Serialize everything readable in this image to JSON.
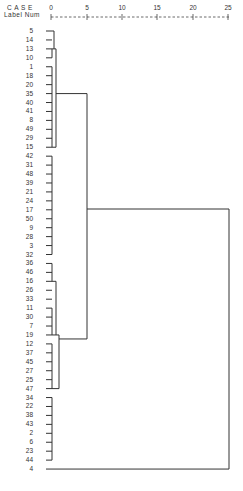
{
  "header": {
    "case_label": "C A S E",
    "label_num": "Label  Num"
  },
  "axis": {
    "ticks": [
      "0",
      "5",
      "10",
      "15",
      "20",
      "25"
    ],
    "line": "+---------+---------+---------+---------+---------+"
  },
  "leaves": [
    "5",
    "14",
    "13",
    "10",
    "1",
    "18",
    "20",
    "35",
    "40",
    "41",
    "8",
    "49",
    "29",
    "15",
    "42",
    "31",
    "48",
    "39",
    "21",
    "24",
    "17",
    "50",
    "9",
    "28",
    "3",
    "32",
    "36",
    "46",
    "16",
    "26",
    "33",
    "11",
    "30",
    "7",
    "19",
    "12",
    "37",
    "45",
    "27",
    "25",
    "47",
    "34",
    "22",
    "38",
    "43",
    "2",
    "6",
    "23",
    "44",
    "4"
  ],
  "chart_data": {
    "type": "dendrogram",
    "title": "",
    "xlabel": "Rescaled Distance Cluster Combine",
    "x_ticks": [
      0,
      5,
      10,
      15,
      20,
      25
    ],
    "xlim": [
      0,
      25
    ],
    "leaf_order": [
      "5",
      "14",
      "13",
      "10",
      "1",
      "18",
      "20",
      "35",
      "40",
      "41",
      "8",
      "49",
      "29",
      "15",
      "42",
      "31",
      "48",
      "39",
      "21",
      "24",
      "17",
      "50",
      "9",
      "28",
      "3",
      "32",
      "36",
      "46",
      "16",
      "26",
      "33",
      "11",
      "30",
      "7",
      "19",
      "12",
      "37",
      "45",
      "27",
      "25",
      "47",
      "34",
      "22",
      "38",
      "43",
      "2",
      "6",
      "23",
      "44",
      "4"
    ],
    "merges": [
      {
        "members": [
          "5",
          "14"
        ],
        "height": 0.5
      },
      {
        "members": [
          "13",
          "10"
        ],
        "height": 0.5
      },
      {
        "members": [
          "1",
          "18",
          "20",
          "35",
          "40",
          "41",
          "8",
          "49",
          "29",
          "15"
        ],
        "height": 0.5
      },
      {
        "members": [
          "[5,14]",
          "[13,10]"
        ],
        "height": 1
      },
      {
        "members": [
          "[13-group]",
          "[1..15]"
        ],
        "height": 1.5
      },
      {
        "members": [
          "42",
          "31",
          "48",
          "39",
          "21",
          "24",
          "17",
          "50",
          "9",
          "28",
          "3",
          "32"
        ],
        "height": 0.5
      },
      {
        "members": [
          "36",
          "46",
          "16"
        ],
        "height": 0.5
      },
      {
        "members": [
          "26",
          "33",
          "11",
          "30",
          "7",
          "19"
        ],
        "height": 0.5
      },
      {
        "members": [
          "[36,46,16]",
          "[26..19]"
        ],
        "height": 1
      },
      {
        "members": [
          "12",
          "37",
          "45",
          "27",
          "25",
          "47"
        ],
        "height": 1
      },
      {
        "members": [
          "[36..19]",
          "[12..47]"
        ],
        "height": 2
      },
      {
        "members": [
          "[5..15]",
          "[36..47]"
        ],
        "height": 5
      },
      {
        "members": [
          "34",
          "22",
          "38",
          "43",
          "2",
          "6",
          "23",
          "44"
        ],
        "height": 0.5
      },
      {
        "members": [
          "[5..47]",
          "[34..44]",
          "4"
        ],
        "height": 25
      }
    ]
  }
}
